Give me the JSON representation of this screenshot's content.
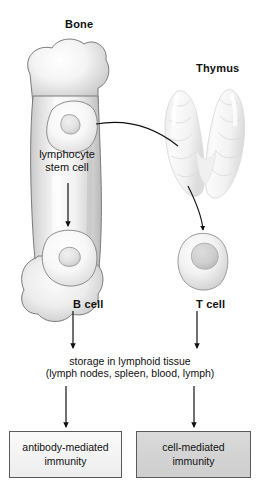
{
  "diagram": {
    "background_color": "#ffffff",
    "line_color": "#111111"
  },
  "organs": [
    {
      "id": "bone",
      "label": "Bone",
      "shape": "long-bone-femur",
      "fill": "#e9e9e9",
      "outline": "#6f6f6f"
    },
    {
      "id": "thymus",
      "label": "Thymus",
      "shape": "bilobed-lobulated",
      "fill": "#f4f4f4",
      "outline": "#d7d7d7"
    }
  ],
  "cells": [
    {
      "id": "stem-cell",
      "label": "lymphocyte\nstem cell",
      "label_line1": "lymphocyte",
      "label_line2": "stem cell",
      "location": "bone"
    },
    {
      "id": "b-cell",
      "label": "B cell",
      "location": "bone"
    },
    {
      "id": "t-cell",
      "label": "T cell",
      "location": "thymus"
    }
  ],
  "stage": {
    "storage_line1": "storage in lymphoid tissue",
    "storage_line2": "(lymph nodes, spleen, blood, lymph)"
  },
  "outcomes": [
    {
      "id": "antibody-mediated",
      "line1": "antibody-mediated",
      "line2": "immunity",
      "fill": "#f3f3f3",
      "border": "#5a5a5a"
    },
    {
      "id": "cell-mediated",
      "line1": "cell-mediated",
      "line2": "immunity",
      "fill": "#d4d4d4",
      "border": "#5a5a5a"
    }
  ],
  "connectors": [
    {
      "id": "stemcell-to-thymus",
      "type": "curve-line",
      "from": "stem-cell",
      "to": "thymus"
    },
    {
      "id": "thymus-to-tcell",
      "type": "curve-arrow",
      "from": "thymus",
      "to": "t-cell"
    },
    {
      "id": "stemcell-to-bcell",
      "type": "straight-arrow",
      "from": "stem-cell",
      "to": "b-cell"
    },
    {
      "id": "bcell-to-storage",
      "type": "straight-arrow",
      "from": "b-cell",
      "to": "storage"
    },
    {
      "id": "tcell-to-storage",
      "type": "straight-arrow",
      "from": "t-cell",
      "to": "storage"
    },
    {
      "id": "storage-to-antibody",
      "type": "straight-arrow",
      "from": "storage",
      "to": "antibody-mediated"
    },
    {
      "id": "storage-to-cellmediated",
      "type": "straight-arrow",
      "from": "storage",
      "to": "cell-mediated"
    }
  ]
}
